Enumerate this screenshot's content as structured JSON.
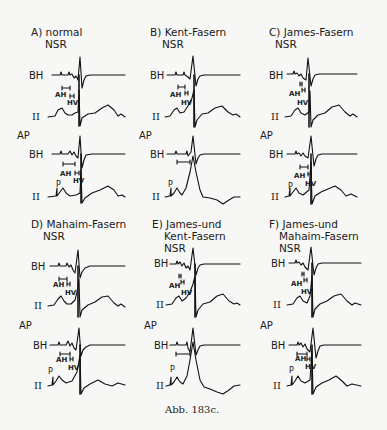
{
  "figure": {
    "caption": "Abb. 183c.",
    "panels": [
      {
        "id": "A",
        "title_lines": [
          "A) normal",
          "NSR"
        ],
        "lead_bh": "BH",
        "lead_ii": "II",
        "ap": "AP",
        "ah": "AH",
        "hv": "HV",
        "h": "H",
        "p": "P"
      },
      {
        "id": "B",
        "title_lines": [
          "B) Kent-Fasern",
          "NSR"
        ],
        "lead_bh": "BH",
        "lead_ii": "II",
        "ap": "AP",
        "ah": "AH",
        "hv": "HV",
        "h": "H",
        "p": "P"
      },
      {
        "id": "C",
        "title_lines": [
          "C) James-Fasern",
          "NSR"
        ],
        "lead_bh": "BH",
        "lead_ii": "II",
        "ap": "AP",
        "ah": "AH",
        "hv": "HV",
        "h": "H",
        "p": "P"
      },
      {
        "id": "D",
        "title_lines": [
          "D) Mahaim-Fasern",
          "NSR"
        ],
        "lead_bh": "BH",
        "lead_ii": "II",
        "ap": "AP",
        "ah": "AH",
        "hv": "HV",
        "h": "H",
        "p": "P"
      },
      {
        "id": "E",
        "title_lines": [
          "E) James-und",
          "Kent-Fasern",
          "NSR"
        ],
        "lead_bh": "BH",
        "lead_ii": "II",
        "ap": "AP",
        "ah": "AH",
        "hv": "HV",
        "h": "H",
        "p": "P"
      },
      {
        "id": "F",
        "title_lines": [
          "F) James-und",
          "Mahaim-Fasern",
          "NSR"
        ],
        "lead_bh": "BH",
        "lead_ii": "II",
        "ap": "AP",
        "ah": "AH",
        "hv": "HV",
        "h": "H",
        "p": "P"
      }
    ]
  }
}
